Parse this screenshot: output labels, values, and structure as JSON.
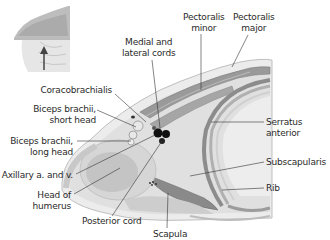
{
  "figure": {
    "inset": {
      "name": "orientation-inset",
      "arrow": "view-from-below-arrow"
    },
    "labels": {
      "pectoralis_minor": [
        "Pectoralis",
        "minor"
      ],
      "pectoralis_major": [
        "Pectoralis",
        "major"
      ],
      "medial_lateral_cords": [
        "Medial and",
        "lateral cords"
      ],
      "coracobrachialis": [
        "Coracobrachialis"
      ],
      "biceps_short": [
        "Biceps brachii,",
        "short head"
      ],
      "biceps_long": [
        "Biceps brachii,",
        "long head"
      ],
      "axillary": [
        "Axillary a. and v."
      ],
      "head_humerus": [
        "Head of",
        "humerus"
      ],
      "posterior_cord": [
        "Posterior cord"
      ],
      "scapula": [
        "Scapula"
      ],
      "serratus": [
        "Serratus",
        "anterior"
      ],
      "subscapularis": [
        "Subscapularis"
      ],
      "rib": [
        "Rib"
      ]
    },
    "colors": {
      "leader_line": "#333333",
      "tissue_light": "#e2e2e2",
      "tissue_mid": "#c8c8c8",
      "muscle_dark": "#9a9a9a",
      "nerve": "#111111",
      "text": "#2a2a2a"
    }
  }
}
